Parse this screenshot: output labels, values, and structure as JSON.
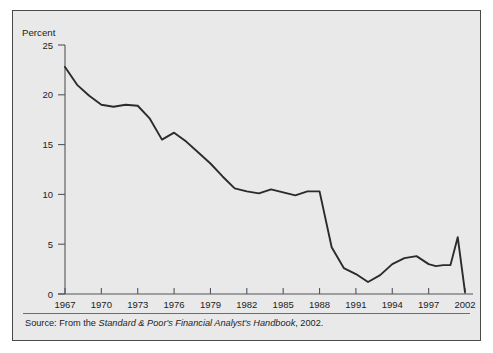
{
  "figure": {
    "background_color": "#e9e9e9",
    "border_color": "#4a4a4a",
    "line_color": "#2b2b2b",
    "axis_color": "#55555b"
  },
  "axis": {
    "y_title": "Percent"
  },
  "source": {
    "prefix": "Source: From the ",
    "title_italic": "Standard & Poor's Financial Analyst's Handbook",
    "suffix": ", 2002."
  },
  "chart_data": {
    "type": "line",
    "title": "",
    "xlabel": "",
    "ylabel": "Percent",
    "ylim": [
      0,
      25
    ],
    "xlim": [
      1967,
      2002
    ],
    "grid": false,
    "legend": false,
    "ytick_labels": [
      "0",
      "5",
      "10",
      "15",
      "20",
      "25"
    ],
    "ytick_values": [
      0,
      5,
      10,
      15,
      20,
      25
    ],
    "xtick_labels": [
      "1967",
      "1970",
      "1973",
      "1976",
      "1979",
      "1982",
      "1985",
      "1988",
      "1991",
      "1994",
      "1997",
      "2002"
    ],
    "xtick_values": [
      1967,
      1970,
      1973,
      1976,
      1979,
      1982,
      1985,
      1988,
      1991,
      1994,
      1997,
      2002
    ],
    "series": [
      {
        "name": "Percent",
        "x": [
          1967,
          1968,
          1969,
          1970,
          1971,
          1972,
          1973,
          1974,
          1975,
          1976,
          1977,
          1978,
          1979,
          1980,
          1981,
          1982,
          1983,
          1984,
          1985,
          1986,
          1987,
          1988,
          1989,
          1990,
          1991,
          1992,
          1993,
          1994,
          1995,
          1996,
          1997,
          1998,
          1999,
          2000,
          2001,
          2002
        ],
        "y": [
          22.8,
          21.0,
          19.9,
          19.0,
          18.8,
          19.0,
          18.9,
          17.6,
          15.5,
          16.2,
          15.3,
          14.2,
          13.1,
          11.8,
          10.6,
          10.3,
          10.1,
          10.5,
          10.2,
          9.9,
          10.3,
          10.3,
          4.7,
          2.6,
          2.0,
          1.2,
          1.9,
          3.0,
          3.6,
          3.8,
          3.0,
          2.8,
          2.9,
          2.9,
          5.7,
          0.2
        ]
      }
    ]
  }
}
